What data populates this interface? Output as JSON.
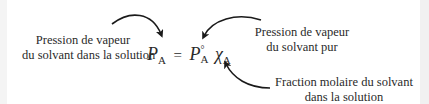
{
  "diagram": {
    "equation": {
      "lhs_symbol": "P",
      "lhs_subscript": "A",
      "operator": "=",
      "rhs_symbol": "P",
      "rhs_superscript": "°",
      "rhs_subscript": "A",
      "chi_symbol": "χ",
      "chi_subscript": "A"
    },
    "labels": {
      "left_line1": "Pression de vapeur",
      "left_line2": "du solvant dans la solution",
      "right_line1": "Pression de vapeur",
      "right_line2": "du solvant pur",
      "bottom_line1": "Fraction molaire du solvant",
      "bottom_line2": "dans la solution"
    },
    "arrow_color": "#1a1a1a",
    "text_color": "#2a2a2a"
  }
}
